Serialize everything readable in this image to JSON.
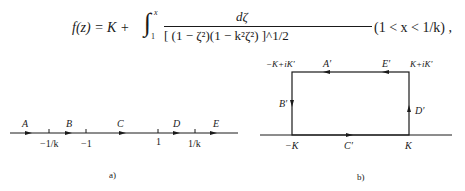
{
  "formula": {
    "lhs": "f(z) = K +",
    "integral_sign": "∫",
    "upper_limit": "x",
    "lower_limit": "1",
    "numerator": "dζ",
    "denominator": "[ (1 − ζ²)(1 − k²ζ²) ]^1/2",
    "condition": "(1 < x < 1/k) ,"
  },
  "diagram_a": {
    "caption": "a)",
    "segment_labels": [
      "A",
      "B",
      "C",
      "D",
      "E"
    ],
    "tick_labels": [
      "−1/k",
      "−1",
      "1",
      "1/k"
    ]
  },
  "diagram_b": {
    "caption": "b)",
    "corner_labels": {
      "top_left": "−K+iK′",
      "top_right": "K+iK′",
      "bottom_left": "−K",
      "bottom_right": "K"
    },
    "edge_labels": {
      "top_left_arrow": "A′",
      "top_right_arrow": "E′",
      "left": "B′",
      "bottom": "C′",
      "right": "D′"
    }
  }
}
